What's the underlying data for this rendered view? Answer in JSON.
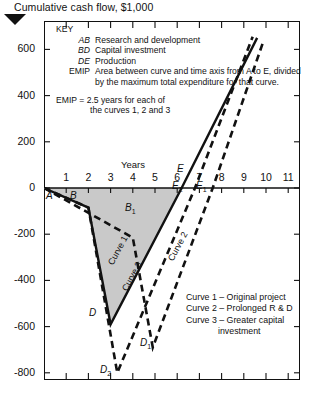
{
  "title": "Cumulative cash flow,  $1,000",
  "key": {
    "heading": "KEY",
    "entries": [
      {
        "code": "AB",
        "text": "Research and development"
      },
      {
        "code": "BD",
        "text": "Capital investment"
      },
      {
        "code": "DE",
        "text": "Production"
      },
      {
        "code": "EMIP",
        "text": "Area between curve and time axis from A to E, divided by the maximum total expenditure for that curve."
      }
    ],
    "emip_note_line1": "EMIP = 2.5 years for each of",
    "emip_note_line2": "the curves 1, 2 and 3"
  },
  "legend": {
    "items": [
      "Curve 1 – Original project",
      "Curve 2 – Prolonged R & D",
      "Curve 3 – Greater capital"
    ],
    "item3_indent": "investment"
  },
  "axes": {
    "xlabel": "Years",
    "xticks": [
      "1",
      "2",
      "3",
      "4",
      "5",
      "6",
      "7",
      "8",
      "9",
      "10",
      "11"
    ],
    "yticks": [
      "600",
      "400",
      "200",
      "0",
      "-200",
      "-400",
      "-600",
      "-800"
    ],
    "xlim": [
      0,
      11.6
    ],
    "ylim": [
      -900,
      700
    ]
  },
  "point_labels": [
    {
      "name": "A",
      "text": "A",
      "sub": ""
    },
    {
      "name": "B",
      "text": "B",
      "sub": ""
    },
    {
      "name": "B1",
      "text": "B",
      "sub": "1"
    },
    {
      "name": "D",
      "text": "D",
      "sub": ""
    },
    {
      "name": "D1",
      "text": "D",
      "sub": "1"
    },
    {
      "name": "D2",
      "text": "D",
      "sub": "2"
    },
    {
      "name": "E",
      "text": "E",
      "sub": ""
    },
    {
      "name": "E1",
      "text": "E",
      "sub": "1"
    },
    {
      "name": "E2",
      "text": "E",
      "sub": "2"
    }
  ],
  "curve_labels": [
    "Curve 1",
    "Curve 2",
    "Curve 3"
  ],
  "colors": {
    "ink": "#111111",
    "shade": "#c9c9c9",
    "background": "#ffffff"
  },
  "chart_data": {
    "type": "line",
    "title": "Cumulative cash flow,  $1,000",
    "xlabel": "Years",
    "ylabel": "Cumulative cash flow, $1,000",
    "xlim": [
      0,
      11.6
    ],
    "ylim": [
      -900,
      700
    ],
    "grid": false,
    "legend_position": "inside-right-lower",
    "shaded_region": {
      "description": "Area between Curve 1 and the time axis from A to E",
      "series": "Curve 1",
      "color": "#c9c9c9"
    },
    "series": [
      {
        "name": "Curve 1",
        "label": "Curve 1 – Original project",
        "style": "solid",
        "points": [
          {
            "x": 0.0,
            "y": 0,
            "point": "A"
          },
          {
            "x": 2.0,
            "y": -85,
            "point": "B"
          },
          {
            "x": 3.0,
            "y": -590,
            "point": "D"
          },
          {
            "x": 6.2,
            "y": 0,
            "point": "E"
          },
          {
            "x": 9.6,
            "y": 650,
            "point": ""
          }
        ]
      },
      {
        "name": "Curve 2",
        "label": "Curve 2 – Prolonged R & D",
        "style": "dashed",
        "points": [
          {
            "x": 0.0,
            "y": 0,
            "point": "A"
          },
          {
            "x": 4.0,
            "y": -215,
            "point": "B1"
          },
          {
            "x": 4.9,
            "y": -690,
            "point": "D1"
          },
          {
            "x": 7.6,
            "y": 0,
            "point": "E1"
          },
          {
            "x": 9.9,
            "y": 640,
            "point": ""
          }
        ]
      },
      {
        "name": "Curve 3",
        "label": "Curve 3 – Greater capital investment",
        "style": "dashed",
        "points": [
          {
            "x": 0.0,
            "y": 0,
            "point": "A"
          },
          {
            "x": 2.0,
            "y": -85,
            "point": "B"
          },
          {
            "x": 3.3,
            "y": -800,
            "point": "D2"
          },
          {
            "x": 6.8,
            "y": 0,
            "point": "E2"
          },
          {
            "x": 9.4,
            "y": 655,
            "point": ""
          }
        ]
      }
    ],
    "annotations": [
      {
        "text": "EMIP = 2.5 years for each of the curves 1, 2 and 3"
      },
      {
        "text": "AB Research and development"
      },
      {
        "text": "BD Capital investment"
      },
      {
        "text": "DE Production"
      }
    ]
  }
}
